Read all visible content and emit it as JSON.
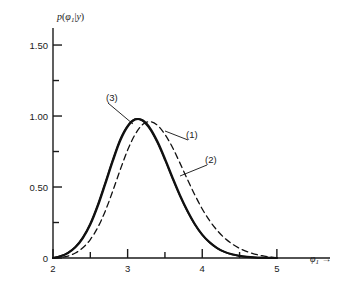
{
  "chart_data": {
    "type": "line",
    "title": "",
    "xlabel": "φ₁ →",
    "ylabel": "p(φ₁|y)",
    "xlim": [
      2,
      5.35
    ],
    "ylim": [
      0,
      1.62
    ],
    "grid": false,
    "legend_position": "inline-annotations",
    "x_ticks": [
      {
        "value": 2,
        "label": "2"
      },
      {
        "value": 2.5,
        "label": ""
      },
      {
        "value": 3,
        "label": "3"
      },
      {
        "value": 3.5,
        "label": ""
      },
      {
        "value": 4,
        "label": "4"
      },
      {
        "value": 4.5,
        "label": ""
      },
      {
        "value": 5,
        "label": "5"
      }
    ],
    "y_ticks": [
      {
        "value": 0.0,
        "label": "0"
      },
      {
        "value": 0.25,
        "label": ""
      },
      {
        "value": 0.5,
        "label": "0.50"
      },
      {
        "value": 0.75,
        "label": ""
      },
      {
        "value": 1.0,
        "label": "1.00"
      },
      {
        "value": 1.25,
        "label": ""
      },
      {
        "value": 1.5,
        "label": "1.50"
      }
    ],
    "series": [
      {
        "name": "(1)",
        "style": "solid",
        "annotation": "(1)",
        "x": [
          2.0,
          2.1,
          2.2,
          2.3,
          2.4,
          2.5,
          2.6,
          2.7,
          2.8,
          2.9,
          3.0,
          3.1,
          3.2,
          3.3,
          3.4,
          3.5,
          3.6,
          3.7,
          3.8,
          3.9,
          4.0,
          4.1,
          4.2,
          4.3,
          4.4,
          4.5,
          4.6,
          4.7,
          4.8,
          4.9,
          5.0
        ],
        "y": [
          0.0,
          0.012,
          0.035,
          0.075,
          0.14,
          0.235,
          0.365,
          0.52,
          0.68,
          0.825,
          0.925,
          0.975,
          0.97,
          0.915,
          0.82,
          0.7,
          0.57,
          0.445,
          0.335,
          0.24,
          0.165,
          0.11,
          0.07,
          0.043,
          0.026,
          0.015,
          0.008,
          0.004,
          0.002,
          0.001,
          0.0
        ]
      },
      {
        "name": "(2)",
        "style": "dashed",
        "annotation": "(2)",
        "x": [
          2.0,
          2.1,
          2.2,
          2.3,
          2.4,
          2.5,
          2.6,
          2.7,
          2.8,
          2.9,
          3.0,
          3.1,
          3.2,
          3.3,
          3.4,
          3.5,
          3.6,
          3.7,
          3.8,
          3.9,
          4.0,
          4.1,
          4.2,
          4.3,
          4.4,
          4.5,
          4.6,
          4.7,
          4.8,
          4.9,
          5.0
        ],
        "y": [
          0.0,
          0.004,
          0.014,
          0.035,
          0.072,
          0.13,
          0.215,
          0.33,
          0.47,
          0.62,
          0.76,
          0.87,
          0.94,
          0.96,
          0.935,
          0.87,
          0.78,
          0.67,
          0.555,
          0.445,
          0.345,
          0.262,
          0.194,
          0.14,
          0.099,
          0.068,
          0.045,
          0.028,
          0.016,
          0.007,
          0.0
        ]
      },
      {
        "name": "(3)",
        "style": "solid-overlay",
        "annotation": "(3)",
        "x": [
          2.0,
          2.1,
          2.2,
          2.3,
          2.4,
          2.5,
          2.6,
          2.7,
          2.8,
          2.9,
          3.0,
          3.1,
          3.2,
          3.3,
          3.4,
          3.5,
          3.6,
          3.7,
          3.8,
          3.9,
          4.0,
          4.1,
          4.2,
          4.3,
          4.4,
          4.5,
          4.6,
          4.7,
          4.8,
          4.9,
          5.0
        ],
        "y": [
          0.0,
          0.013,
          0.037,
          0.079,
          0.146,
          0.244,
          0.376,
          0.532,
          0.692,
          0.836,
          0.932,
          0.978,
          0.966,
          0.906,
          0.81,
          0.69,
          0.56,
          0.437,
          0.328,
          0.236,
          0.162,
          0.108,
          0.069,
          0.042,
          0.025,
          0.014,
          0.008,
          0.004,
          0.002,
          0.001,
          0.0
        ]
      }
    ],
    "annotations": [
      {
        "text": "(3)",
        "x_px": 106,
        "y_px": 101,
        "leader_to_px": [
          133,
          124
        ]
      },
      {
        "text": "(1)",
        "x_px": 186,
        "y_px": 138,
        "leader_to_px": [
          165,
          131
        ]
      },
      {
        "text": "(2)",
        "x_px": 205,
        "y_px": 163,
        "leader_to_px": [
          180,
          176
        ]
      }
    ],
    "colors": {
      "line": "#111111",
      "axis": "#1a1a1a",
      "background": "#ffffff"
    }
  }
}
